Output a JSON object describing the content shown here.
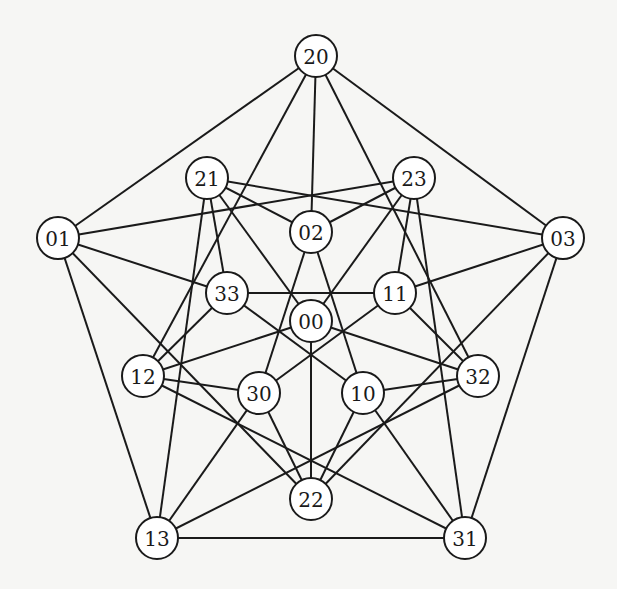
{
  "diagram": {
    "type": "undirected-graph",
    "node_radius": 21,
    "colors": {
      "stroke": "#1a1a1a",
      "node_fill": "#ffffff",
      "background": "#f6f6f4"
    },
    "nodes": [
      {
        "id": "20",
        "label": "20",
        "x": 316,
        "y": 56
      },
      {
        "id": "21",
        "label": "21",
        "x": 207,
        "y": 178
      },
      {
        "id": "23",
        "label": "23",
        "x": 414,
        "y": 178
      },
      {
        "id": "02",
        "label": "02",
        "x": 311,
        "y": 232
      },
      {
        "id": "01",
        "label": "01",
        "x": 58,
        "y": 238
      },
      {
        "id": "03",
        "label": "03",
        "x": 563,
        "y": 238
      },
      {
        "id": "33",
        "label": "33",
        "x": 227,
        "y": 293
      },
      {
        "id": "11",
        "label": "11",
        "x": 395,
        "y": 293
      },
      {
        "id": "00",
        "label": "00",
        "x": 311,
        "y": 321
      },
      {
        "id": "12",
        "label": "12",
        "x": 143,
        "y": 376
      },
      {
        "id": "30",
        "label": "30",
        "x": 259,
        "y": 393
      },
      {
        "id": "10",
        "label": "10",
        "x": 363,
        "y": 393
      },
      {
        "id": "32",
        "label": "32",
        "x": 478,
        "y": 376
      },
      {
        "id": "22",
        "label": "22",
        "x": 311,
        "y": 499
      },
      {
        "id": "13",
        "label": "13",
        "x": 157,
        "y": 538
      },
      {
        "id": "31",
        "label": "31",
        "x": 465,
        "y": 538
      }
    ],
    "edges": [
      [
        "20",
        "01"
      ],
      [
        "20",
        "03"
      ],
      [
        "20",
        "02"
      ],
      [
        "20",
        "12"
      ],
      [
        "20",
        "32"
      ],
      [
        "01",
        "23"
      ],
      [
        "01",
        "33"
      ],
      [
        "01",
        "22"
      ],
      [
        "01",
        "13"
      ],
      [
        "03",
        "21"
      ],
      [
        "03",
        "11"
      ],
      [
        "03",
        "22"
      ],
      [
        "03",
        "31"
      ],
      [
        "21",
        "02"
      ],
      [
        "21",
        "00"
      ],
      [
        "21",
        "33"
      ],
      [
        "21",
        "13"
      ],
      [
        "23",
        "02"
      ],
      [
        "23",
        "00"
      ],
      [
        "23",
        "11"
      ],
      [
        "23",
        "31"
      ],
      [
        "02",
        "30"
      ],
      [
        "02",
        "10"
      ],
      [
        "33",
        "11"
      ],
      [
        "33",
        "12"
      ],
      [
        "33",
        "10"
      ],
      [
        "11",
        "32"
      ],
      [
        "11",
        "30"
      ],
      [
        "00",
        "12"
      ],
      [
        "00",
        "32"
      ],
      [
        "00",
        "22"
      ],
      [
        "12",
        "30"
      ],
      [
        "12",
        "31"
      ],
      [
        "32",
        "10"
      ],
      [
        "32",
        "13"
      ],
      [
        "30",
        "22"
      ],
      [
        "30",
        "13"
      ],
      [
        "10",
        "22"
      ],
      [
        "10",
        "31"
      ],
      [
        "13",
        "31"
      ]
    ]
  }
}
